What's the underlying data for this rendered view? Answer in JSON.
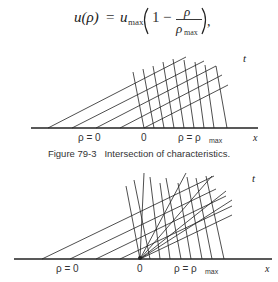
{
  "equation": {
    "lhs": "u(ρ)",
    "equals": "=",
    "umax": "u",
    "umax_sub": "max",
    "one": "1",
    "minus": "−",
    "num": "ρ",
    "den": "ρ",
    "den_sub": "max",
    "trail": ","
  },
  "figure1": {
    "t_label": "t",
    "x_label": "x",
    "rho_zero": "ρ = 0",
    "origin": "0",
    "rho_max": "ρ = ρ",
    "rho_max_sub": "max",
    "caption": "Figure 79-3   Intersection of characteristics."
  },
  "figure2": {
    "t_label": "t",
    "x_label": "x",
    "rho_zero": "ρ = 0",
    "origin": "0",
    "rho_max": "ρ = ρ",
    "rho_max_sub": "max"
  },
  "colors": {
    "line": "#222222",
    "text": "#333333",
    "background": "#ffffff"
  }
}
